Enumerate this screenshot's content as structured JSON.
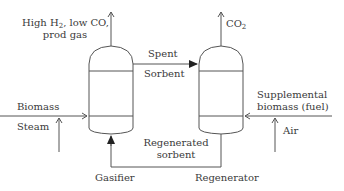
{
  "diagram": {
    "units": [
      {
        "id": "gasifier",
        "label": "Gasifier"
      },
      {
        "id": "regenerator",
        "label": "Regenerator"
      }
    ],
    "streams": {
      "product_gas": {
        "line1_pre": "High H",
        "line1_sub": "2",
        "line1_post": ", low CO,",
        "line2": "prod gas"
      },
      "co2": {
        "main": "CO",
        "sub": "2"
      },
      "spent_sorbent": {
        "line1": "Spent",
        "line2": "Sorbent"
      },
      "biomass": "Biomass",
      "steam": "Steam",
      "regenerated_sorbent": {
        "line1": "Regenerated",
        "line2": "sorbent"
      },
      "supplemental": {
        "line1": "Supplemental",
        "line2": "biomass (fuel)"
      },
      "air": "Air"
    },
    "colors": {
      "line": "#555555",
      "text": "#3a3a3a",
      "background": "#ffffff"
    }
  }
}
